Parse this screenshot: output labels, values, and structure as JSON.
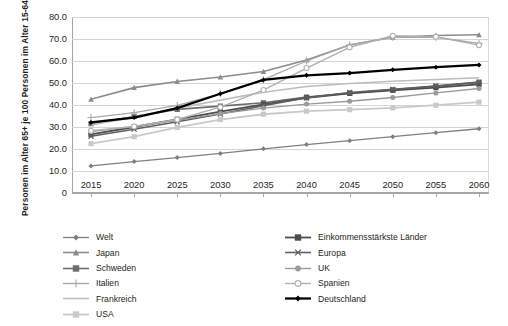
{
  "chart_data": {
    "type": "line",
    "title": "",
    "xlabel": "",
    "ylabel": "Personen im Alter 65+ je 100 Personen im Alter 15-64",
    "x": [
      2015,
      2020,
      2025,
      2030,
      2035,
      2040,
      2045,
      2050,
      2055,
      2060
    ],
    "xlim": [
      2015,
      2060
    ],
    "ylim": [
      0,
      80
    ],
    "ytick_labels": [
      "0",
      "10.0",
      "20.0",
      "30.0",
      "40.0",
      "50.0",
      "60.0",
      "70.0",
      "80.0"
    ],
    "ytick_values": [
      0,
      10,
      20,
      30,
      40,
      50,
      60,
      70,
      80
    ],
    "xtick_labels": [
      "2015",
      "2020",
      "2025",
      "2030",
      "2035",
      "2040",
      "2045",
      "2050",
      "2055",
      "2060"
    ],
    "grid": true,
    "legend_position": "bottom",
    "series": [
      {
        "name": "Welt",
        "color": "#7f7f7f",
        "marker": "diamond",
        "width": 1.3,
        "values": [
          12.3,
          14.3,
          16.1,
          18.0,
          20.1,
          22.0,
          23.8,
          25.6,
          27.4,
          29.2
        ]
      },
      {
        "name": "Japan",
        "color": "#8c8c8c",
        "marker": "triangle",
        "width": 1.6,
        "values": [
          42.6,
          47.9,
          50.7,
          52.7,
          55.2,
          60.5,
          67.3,
          70.8,
          71.6,
          71.9
        ]
      },
      {
        "name": "Schweden",
        "color": "#6d6d6d",
        "marker": "square",
        "width": 1.6,
        "values": [
          31.5,
          34.8,
          38.0,
          39.5,
          41.0,
          43.6,
          45.4,
          46.9,
          48.6,
          50.4
        ]
      },
      {
        "name": "Italien",
        "color": "#a8a8a8",
        "marker": "plus",
        "width": 1.3,
        "values": [
          34.3,
          36.5,
          39.8,
          45.1,
          51.5,
          60.0,
          67.3,
          70.8,
          70.8,
          68.0
        ]
      },
      {
        "name": "Frankreich",
        "color": "#bdbdbd",
        "marker": "none",
        "width": 1.6,
        "values": [
          30.9,
          34.5,
          38.5,
          42.2,
          45.8,
          48.4,
          49.8,
          50.8,
          51.6,
          52.4
        ]
      },
      {
        "name": "USA",
        "color": "#c9c9c9",
        "marker": "square",
        "width": 1.8,
        "values": [
          22.4,
          25.6,
          29.8,
          33.4,
          35.8,
          37.2,
          37.9,
          38.7,
          39.9,
          41.3
        ]
      },
      {
        "name": "Einkommensstärkste Länder",
        "color": "#4d4d4d",
        "marker": "square",
        "width": 1.8,
        "values": [
          26.6,
          30.0,
          33.5,
          37.0,
          40.3,
          43.3,
          45.3,
          46.7,
          47.9,
          49.4
        ]
      },
      {
        "name": "Europa",
        "color": "#5f5f5f",
        "marker": "x",
        "width": 1.6,
        "values": [
          25.8,
          29.0,
          32.4,
          35.9,
          39.7,
          43.3,
          45.7,
          47.1,
          48.6,
          50.3
        ]
      },
      {
        "name": "UK",
        "color": "#9a9a9a",
        "marker": "circle-filled",
        "width": 1.4,
        "values": [
          27.9,
          30.3,
          33.0,
          36.1,
          38.6,
          40.4,
          41.7,
          43.4,
          45.5,
          47.5
        ]
      },
      {
        "name": "Spanien",
        "color": "#b0b0b0",
        "marker": "circle-open",
        "width": 1.4,
        "values": [
          28.3,
          30.2,
          33.4,
          39.0,
          46.8,
          56.8,
          66.2,
          71.5,
          71.0,
          67.2
        ]
      },
      {
        "name": "Deutschland",
        "color": "#000000",
        "marker": "diamond",
        "width": 2.3,
        "values": [
          32.1,
          34.3,
          38.6,
          45.1,
          51.4,
          53.5,
          54.5,
          56.0,
          57.2,
          58.2
        ]
      }
    ]
  },
  "legend": {
    "left_column": [
      "Welt",
      "Japan",
      "Schweden",
      "Italien",
      "Frankreich",
      "USA"
    ],
    "right_column": [
      "Einkommensstärkste Länder",
      "Europa",
      "UK",
      "Spanien",
      "Deutschland"
    ]
  }
}
